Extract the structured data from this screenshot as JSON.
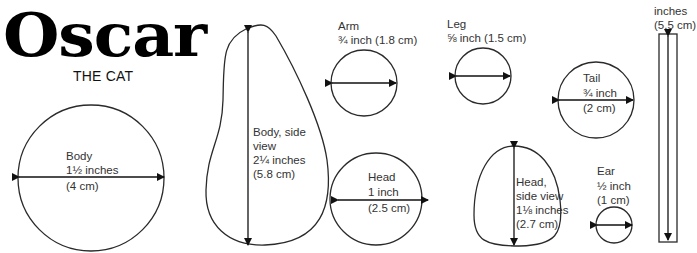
{
  "title": {
    "main": "Oscar",
    "subtitle": "THE CAT"
  },
  "colors": {
    "stroke": "#2a2a2a",
    "text": "#333333",
    "title": "#000000"
  },
  "pieces": {
    "body": {
      "name": "Body",
      "size_in": "1½ inches",
      "size_cm": "(4 cm)"
    },
    "body_side": {
      "name": "Body, side",
      "name2": "view",
      "size_in": "2¼ inches",
      "size_cm": "(5.8 cm)"
    },
    "arm": {
      "name": "Arm",
      "size": "¾ inch (1.8 cm)"
    },
    "leg": {
      "name": "Leg",
      "size": "⅝ inch (1.5 cm)"
    },
    "head": {
      "name": "Head",
      "size_in": "1 inch",
      "size_cm": "(2.5 cm)"
    },
    "head_side": {
      "name": "Head,",
      "name2": "side view",
      "size_in": "1⅛ inches",
      "size_cm": "(2.7 cm)"
    },
    "tail": {
      "name": "Tail",
      "size_in": "¾ inch",
      "size_cm": "(2 cm)"
    },
    "ear": {
      "name": "Ear",
      "size_in": "½ inch",
      "size_cm": "(1 cm)"
    },
    "strip": {
      "size_in": "inches",
      "size_cm": "(5.5 cm)"
    }
  }
}
